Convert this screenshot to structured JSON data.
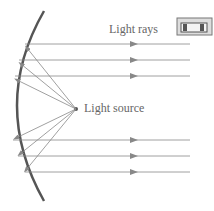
{
  "diagram": {
    "labels": {
      "light_rays": "Light rays",
      "light_source": "Light source"
    },
    "colors": {
      "mirror": "#555555",
      "rays": "#888888",
      "text": "#666666"
    },
    "icons": [
      "flashlight-icon"
    ]
  }
}
